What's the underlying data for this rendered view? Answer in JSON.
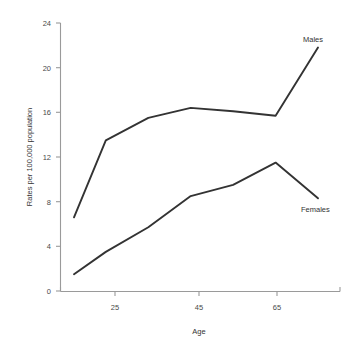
{
  "chart_data": {
    "type": "line",
    "title": "",
    "xlabel": "Age",
    "ylabel": "Rates per 100,000 population",
    "xlim": [
      17.5,
      75
    ],
    "ylim": [
      0,
      24
    ],
    "grid": false,
    "legend_position": "inline-right",
    "x_ticks": [
      25,
      45,
      65
    ],
    "x_tick_labels": [
      "25",
      "45",
      "65"
    ],
    "y_ticks": [
      0,
      4,
      8,
      12,
      16,
      20,
      24
    ],
    "y_tick_labels": [
      "0",
      "4",
      "8",
      "12",
      "16",
      "20",
      "24"
    ],
    "x": [
      17.5,
      25,
      35,
      45,
      55,
      65,
      75
    ],
    "series": [
      {
        "name": "Males",
        "color": "#333333",
        "values": [
          6.6,
          13.5,
          15.5,
          16.4,
          16.1,
          15.7,
          21.8
        ],
        "label_text": "Males"
      },
      {
        "name": "Females",
        "color": "#333333",
        "values": [
          1.5,
          3.5,
          5.7,
          8.5,
          9.5,
          11.5,
          8.3
        ],
        "label_text": "Females"
      }
    ]
  },
  "axes": {
    "x_axis_title": "Age",
    "y_axis_title": "Rates per 100,000 population",
    "x_tick_labels": [
      "25",
      "45",
      "65"
    ],
    "y_tick_labels": [
      "24",
      "20",
      "16",
      "12",
      "8",
      "4",
      "0"
    ]
  },
  "annotations": {
    "males_label": "Males",
    "females_label": "Females"
  },
  "colors": {
    "line": "#333333",
    "axis": "#9a9a9a",
    "text": "#333333",
    "background": "#ffffff"
  }
}
